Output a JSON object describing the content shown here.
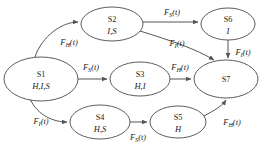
{
  "diagram": {
    "type": "state-transition-diagram",
    "nodes": [
      {
        "key": "s1",
        "id": "S1",
        "sub": "H,I,S",
        "cx": 41,
        "cy": 79,
        "rx": 37,
        "ry": 22
      },
      {
        "key": "s2",
        "id": "S2",
        "sub": "I,S",
        "cx": 112,
        "cy": 24,
        "rx": 31,
        "ry": 17
      },
      {
        "key": "s3",
        "id": "S3",
        "sub": "H,I",
        "cx": 140,
        "cy": 79,
        "rx": 30,
        "ry": 17
      },
      {
        "key": "s4",
        "id": "S4",
        "sub": "H,S",
        "cx": 100,
        "cy": 122,
        "rx": 30,
        "ry": 17
      },
      {
        "key": "s5",
        "id": "S5",
        "sub": "H",
        "cx": 178,
        "cy": 122,
        "rx": 28,
        "ry": 16
      },
      {
        "key": "s6",
        "id": "S6",
        "sub": "I",
        "cx": 228,
        "cy": 24,
        "rx": 27,
        "ry": 16
      },
      {
        "key": "s7",
        "id": "S7",
        "sub": "",
        "cx": 226,
        "cy": 79,
        "rx": 32,
        "ry": 19
      }
    ],
    "edges": [
      {
        "key": "s1-s2",
        "from": "S1",
        "to": "S2",
        "fn": "F",
        "subscript": "H",
        "arg": "(t)",
        "label": "F_H(t)",
        "lx": 69,
        "ly": 45
      },
      {
        "key": "s2-s6",
        "from": "S2",
        "to": "S6",
        "fn": "F",
        "subscript": "S",
        "arg": "(t)",
        "label": "F_S(t)",
        "lx": 172,
        "ly": 15
      },
      {
        "key": "s2-s7",
        "from": "S2",
        "to": "S7",
        "fn": "F",
        "subscript": "I",
        "arg": "(t)",
        "label": "F_I(t)",
        "lx": 177,
        "ly": 46
      },
      {
        "key": "s6-s7",
        "from": "S6",
        "to": "S7",
        "fn": "F",
        "subscript": "I",
        "arg": "(t)",
        "label": "F_I(t)",
        "lx": 243,
        "ly": 55
      },
      {
        "key": "s1-s3",
        "from": "S1",
        "to": "S3",
        "fn": "F",
        "subscript": "S",
        "arg": "(t)",
        "label": "F_S(t)",
        "lx": 91,
        "ly": 70
      },
      {
        "key": "s3-s7",
        "from": "S3",
        "to": "S7",
        "fn": "F",
        "subscript": "H",
        "arg": "(t)",
        "label": "F_H(t)",
        "lx": 180,
        "ly": 70
      },
      {
        "key": "s1-s4",
        "from": "S1",
        "to": "S4",
        "fn": "F",
        "subscript": "I",
        "arg": "(t)",
        "label": "F_I(t)",
        "lx": 41,
        "ly": 124
      },
      {
        "key": "s4-s5",
        "from": "S4",
        "to": "S5",
        "fn": "F",
        "subscript": "S",
        "arg": "(t)",
        "label": "F_S(t)",
        "lx": 138,
        "ly": 140
      },
      {
        "key": "s5-s7",
        "from": "S5",
        "to": "S7",
        "fn": "F",
        "subscript": "H",
        "arg": "(t)",
        "label": "F_H(t)",
        "lx": 232,
        "ly": 125
      }
    ],
    "colors": {
      "node_stroke": "#4a4a4a",
      "edge_stroke": "#555555",
      "text": "#1a1a1a",
      "background": "#ffffff"
    }
  }
}
